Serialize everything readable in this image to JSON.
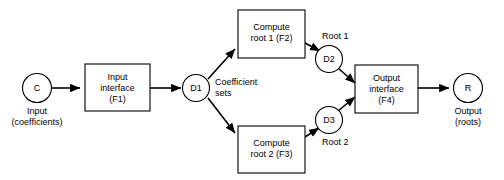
{
  "diagram": {
    "colors": {
      "stroke": "#000000",
      "fill": "#ffffff",
      "background": "#ffffff"
    },
    "terminators": [
      {
        "id": "C",
        "label": "C",
        "caption_line1": "Input",
        "caption_line2": "(coefficients)"
      },
      {
        "id": "R",
        "label": "R",
        "caption_line1": "Output",
        "caption_line2": "(roots)"
      }
    ],
    "processes": [
      {
        "id": "F1",
        "line1": "Input",
        "line2": "interface",
        "line3": "(F1)"
      },
      {
        "id": "F2",
        "line1": "Compute",
        "line2": "root 1 (F2)",
        "line3": ""
      },
      {
        "id": "F3",
        "line1": "Compute",
        "line2": "root 2 (F3)",
        "line3": ""
      },
      {
        "id": "F4",
        "line1": "Output",
        "line2": "interface",
        "line3": "(F4)"
      }
    ],
    "datastores": [
      {
        "id": "D1",
        "label": "D1"
      },
      {
        "id": "D2",
        "label": "D2"
      },
      {
        "id": "D3",
        "label": "D3"
      }
    ],
    "edge_labels": [
      {
        "id": "coefficient-sets",
        "line1": "Coefficient",
        "line2": "sets"
      },
      {
        "id": "root-1",
        "line1": "Root 1",
        "line2": ""
      },
      {
        "id": "root-2",
        "line1": "Root 2",
        "line2": ""
      }
    ]
  }
}
